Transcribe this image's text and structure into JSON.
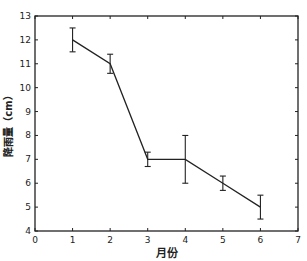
{
  "chart_data": {
    "type": "line",
    "title": "",
    "xlabel": "月份",
    "ylabel": "降雨量（cm）",
    "x": [
      1,
      2,
      3,
      4,
      5,
      6
    ],
    "series": [
      {
        "name": "降雨量",
        "values": [
          12.0,
          11.0,
          7.0,
          7.0,
          6.0,
          5.0
        ],
        "error": [
          0.5,
          0.4,
          0.3,
          1.0,
          0.3,
          0.5
        ]
      }
    ],
    "xlim": [
      0,
      7
    ],
    "ylim": [
      4,
      13
    ],
    "xticks": [
      0,
      1,
      2,
      3,
      4,
      5,
      6,
      7
    ],
    "yticks": [
      4,
      5,
      6,
      7,
      8,
      9,
      10,
      11,
      12,
      13
    ],
    "grid": false,
    "legend": "none",
    "colors": {
      "line": "#222222",
      "axis": "#222222",
      "background": "#ffffff"
    }
  }
}
